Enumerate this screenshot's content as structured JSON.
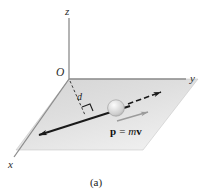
{
  "figure": {
    "caption": "(a)",
    "background_color": "#ffffff",
    "axes": {
      "origin_label": "O",
      "z_label": "z",
      "y_label": "y",
      "x_label": "x",
      "axis_color": "#8c8c8c"
    },
    "plane": {
      "name": "xy-plane",
      "fill_color": "#dcdcdc",
      "edge_color": "#a8a8a8"
    },
    "particle": {
      "name": "particle-sphere",
      "fill_color": "#d2d2d2",
      "highlight_color": "#f2f2f2",
      "edge_color": "#9a9a9a"
    },
    "trajectory": {
      "name": "line-of-motion",
      "color": "#1a1a1a",
      "arrow_direction": "toward lower-left"
    },
    "velocity_arrow": {
      "name": "dashed-direction-arrow",
      "color": "#1a1a1a",
      "style": "dashed"
    },
    "momentum_vector": {
      "label": "p = mv",
      "label_parts": {
        "p": "p",
        "equals": "=",
        "m": "m",
        "v": "v"
      },
      "arrow_color": "#9b9b9b"
    },
    "perpendicular": {
      "label": "d",
      "description": "perpendicular distance from origin to line of motion",
      "line_color": "#3a3a3a",
      "style": "dashed",
      "right_angle_marker": true
    }
  }
}
